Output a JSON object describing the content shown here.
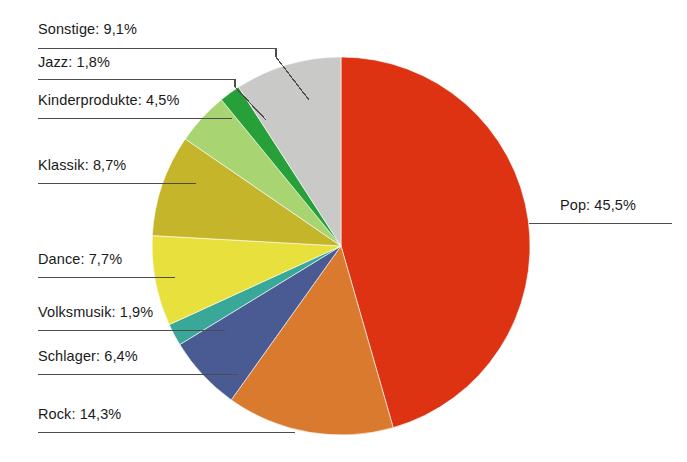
{
  "chart_data": {
    "type": "pie",
    "title": "",
    "subtitle": "",
    "xlabel": "",
    "ylabel": "",
    "grid": false,
    "legend_position": "callout-labels",
    "label_format": "{name}: {value}%",
    "decimal_separator": ",",
    "start_angle_deg": 0,
    "direction": "clockwise",
    "categories": [
      "Pop",
      "Rock",
      "Schlager",
      "Volksmusik",
      "Dance",
      "Klassik",
      "Kinderprodukte",
      "Jazz",
      "Sonstige"
    ],
    "values": [
      45.5,
      14.3,
      6.4,
      1.9,
      7.7,
      8.7,
      4.5,
      1.8,
      9.1
    ],
    "total": 99.9,
    "slices": [
      {
        "name": "Pop",
        "value": 45.5,
        "label": "Pop: 45,5%",
        "color": "#dd3312"
      },
      {
        "name": "Rock",
        "value": 14.3,
        "label": "Rock: 14,3%",
        "color": "#d97a2e"
      },
      {
        "name": "Schlager",
        "value": 6.4,
        "label": "Schlager: 6,4%",
        "color": "#4a5b94"
      },
      {
        "name": "Volksmusik",
        "value": 1.9,
        "label": "Volksmusik: 1,9%",
        "color": "#3aa898"
      },
      {
        "name": "Dance",
        "value": 7.7,
        "label": "Dance: 7,7%",
        "color": "#e8e03c"
      },
      {
        "name": "Klassik",
        "value": 8.7,
        "label": "Klassik: 8,7%",
        "color": "#c4b52a"
      },
      {
        "name": "Kinderprodukte",
        "value": 4.5,
        "label": "Kinderprodukte: 4,5%",
        "color": "#a8d472"
      },
      {
        "name": "Jazz",
        "value": 1.8,
        "label": "Jazz: 1,8%",
        "color": "#27a03a"
      },
      {
        "name": "Sonstige",
        "value": 9.1,
        "label": "Sonstige: 9,1%",
        "color": "#c9cac8"
      }
    ]
  },
  "labels": {
    "sonstige": "Sonstige: 9,1%",
    "jazz": "Jazz: 1,8%",
    "kinderprodukte": "Kinderprodukte: 4,5%",
    "klassik": "Klassik: 8,7%",
    "dance": "Dance: 7,7%",
    "volksmusik": "Volksmusik: 1,9%",
    "schlager": "Schlager: 6,4%",
    "rock": "Rock: 14,3%",
    "pop": "Pop: 45,5%"
  },
  "style": {
    "background": "#ffffff",
    "leader_line_color": "#4d4d4d",
    "text_color": "#1a1a1a"
  }
}
